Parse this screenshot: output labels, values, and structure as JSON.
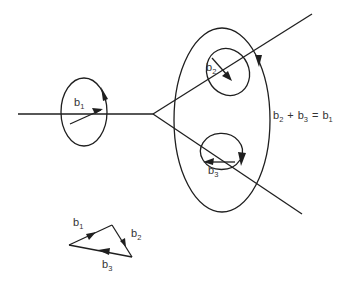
{
  "diagram": {
    "type": "burgers-vector-node",
    "labels": {
      "b1_loop": {
        "base": "b",
        "sub": "1"
      },
      "b2_loop": {
        "base": "b",
        "sub": "2"
      },
      "b3_loop": {
        "base": "b",
        "sub": "3"
      },
      "equation": {
        "t1": "b",
        "s1": "2",
        "plus": "+",
        "t2": "b",
        "s2": "3",
        "eq": "=",
        "t3": "b",
        "s3": "1"
      },
      "triangle_b1": {
        "base": "b",
        "sub": "1"
      },
      "triangle_b2": {
        "base": "b",
        "sub": "2"
      },
      "triangle_b3": {
        "base": "b",
        "sub": "3"
      }
    },
    "colors": {
      "stroke": "#1f1f1f",
      "background": "#ffffff",
      "text": "#333333"
    }
  }
}
